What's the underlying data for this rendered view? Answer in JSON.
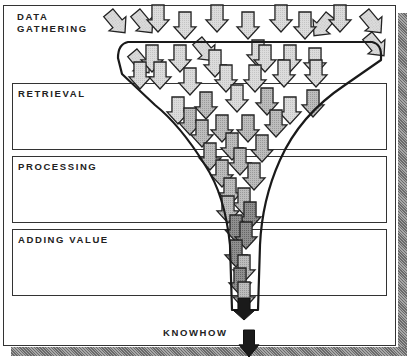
{
  "diagram": {
    "stages": [
      {
        "id": "data-gathering",
        "line1": "DATA",
        "line2": "GATHERING"
      },
      {
        "id": "retrieval",
        "label": "RETRIEVAL"
      },
      {
        "id": "processing",
        "label": "PROCESSING"
      },
      {
        "id": "adding-value",
        "label": "ADDING VALUE"
      }
    ],
    "output_label": "KNOWHOW",
    "colors": {
      "frame": "#333333",
      "arrow_light": "#d8d8d8",
      "arrow_mid": "#b4b4b4",
      "arrow_dark": "#888888",
      "arrow_black": "#1a1a1a",
      "shadow": "#8a8a8a"
    },
    "arrows": [
      {
        "x": 158,
        "y": 5,
        "shade": "light"
      },
      {
        "x": 185,
        "y": 12,
        "shade": "light"
      },
      {
        "x": 217,
        "y": 5,
        "shade": "light"
      },
      {
        "x": 248,
        "y": 12,
        "shade": "light"
      },
      {
        "x": 281,
        "y": 5,
        "shade": "light"
      },
      {
        "x": 305,
        "y": 12,
        "shade": "light"
      },
      {
        "x": 340,
        "y": 5,
        "shade": "light"
      },
      {
        "x": 258,
        "y": 40,
        "shade": "light"
      },
      {
        "x": 152,
        "y": 45,
        "shade": "light"
      },
      {
        "x": 180,
        "y": 45,
        "shade": "light"
      },
      {
        "x": 215,
        "y": 50,
        "shade": "light"
      },
      {
        "x": 265,
        "y": 45,
        "shade": "light"
      },
      {
        "x": 290,
        "y": 45,
        "shade": "light"
      },
      {
        "x": 315,
        "y": 48,
        "shade": "light"
      },
      {
        "x": 140,
        "y": 62,
        "shade": "light"
      },
      {
        "x": 160,
        "y": 62,
        "shade": "light"
      },
      {
        "x": 190,
        "y": 68,
        "shade": "light"
      },
      {
        "x": 226,
        "y": 65,
        "shade": "light"
      },
      {
        "x": 255,
        "y": 65,
        "shade": "light"
      },
      {
        "x": 284,
        "y": 60,
        "shade": "light"
      },
      {
        "x": 316,
        "y": 60,
        "shade": "light"
      },
      {
        "x": 178,
        "y": 97,
        "shade": "light"
      },
      {
        "x": 206,
        "y": 92,
        "shade": "mid"
      },
      {
        "x": 237,
        "y": 85,
        "shade": "light"
      },
      {
        "x": 267,
        "y": 88,
        "shade": "mid"
      },
      {
        "x": 290,
        "y": 97,
        "shade": "light"
      },
      {
        "x": 313,
        "y": 90,
        "shade": "mid"
      },
      {
        "x": 190,
        "y": 108,
        "shade": "mid"
      },
      {
        "x": 222,
        "y": 115,
        "shade": "mid"
      },
      {
        "x": 248,
        "y": 115,
        "shade": "mid"
      },
      {
        "x": 276,
        "y": 110,
        "shade": "mid"
      },
      {
        "x": 202,
        "y": 120,
        "shade": "mid"
      },
      {
        "x": 232,
        "y": 133,
        "shade": "mid"
      },
      {
        "x": 262,
        "y": 135,
        "shade": "mid"
      },
      {
        "x": 210,
        "y": 143,
        "shade": "mid"
      },
      {
        "x": 240,
        "y": 148,
        "shade": "mid"
      },
      {
        "x": 222,
        "y": 160,
        "shade": "mid"
      },
      {
        "x": 254,
        "y": 163,
        "shade": "mid"
      },
      {
        "x": 230,
        "y": 178,
        "shade": "mid"
      },
      {
        "x": 244,
        "y": 188,
        "shade": "mid"
      },
      {
        "x": 228,
        "y": 196,
        "shade": "mid"
      },
      {
        "x": 250,
        "y": 202,
        "shade": "dark"
      },
      {
        "x": 236,
        "y": 215,
        "shade": "dark"
      },
      {
        "x": 246,
        "y": 222,
        "shade": "dark"
      },
      {
        "x": 236,
        "y": 240,
        "shade": "dark"
      },
      {
        "x": 244,
        "y": 255,
        "shade": "mid"
      },
      {
        "x": 240,
        "y": 268,
        "shade": "dark"
      },
      {
        "x": 244,
        "y": 282,
        "shade": "mid"
      }
    ],
    "tilted_arrows": [
      {
        "x": 116,
        "y": 22,
        "rot": -40,
        "shade": "light"
      },
      {
        "x": 143,
        "y": 22,
        "rot": -40,
        "shade": "light"
      },
      {
        "x": 323,
        "y": 25,
        "rot": 40,
        "shade": "light"
      },
      {
        "x": 372,
        "y": 22,
        "rot": -40,
        "shade": "light"
      },
      {
        "x": 375,
        "y": 45,
        "rot": -40,
        "shade": "light"
      },
      {
        "x": 140,
        "y": 62,
        "rot": -40,
        "shade": "light"
      },
      {
        "x": 205,
        "y": 50,
        "rot": -40,
        "shade": "light"
      }
    ],
    "black_arrows": [
      {
        "x": 244,
        "y": 298,
        "w": 22,
        "h": 22
      },
      {
        "x": 249,
        "y": 330,
        "w": 20,
        "h": 27
      }
    ]
  }
}
